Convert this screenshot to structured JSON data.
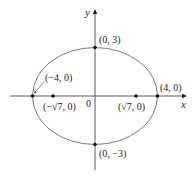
{
  "diagram": {
    "type": "ellipse",
    "axes": {
      "x_label": "x",
      "y_label": "y",
      "origin_label": "0"
    },
    "points": {
      "top": "(0, 3)",
      "bottom": "(0, −3)",
      "left_vertex": "(−4, 0)",
      "right_vertex": "(4, 0)",
      "left_focus": "(−√7, 0)",
      "right_focus": "(√7, 0)"
    },
    "colors": {
      "stroke": "#333333",
      "point": "#111111"
    }
  }
}
